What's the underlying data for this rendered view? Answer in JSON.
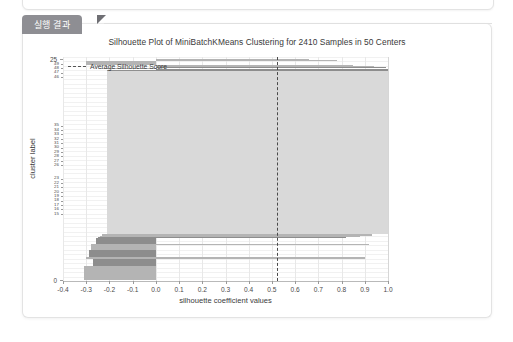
{
  "panel": {
    "tab_label": "실행 결과"
  },
  "chart_data": {
    "type": "bar",
    "title": "Silhouette Plot of MiniBatchKMeans Clustering for 2410 Samples in 50 Centers",
    "xlabel": "silhouette coefficient values",
    "ylabel": "cluster label",
    "xlim": [
      -0.4,
      1.0
    ],
    "ylim": [
      0,
      50
    ],
    "grid": true,
    "legend_position": "upper left",
    "legend": [
      {
        "name": "Average Silhouette Score",
        "style": "dashed",
        "color": "#4a4a4a"
      }
    ],
    "annotations": [
      {
        "label": "Average Silhouette Score",
        "type": "vline",
        "x": 0.52
      }
    ],
    "xticks": [
      "-0.4",
      "-0.3",
      "-0.2",
      "-0.1",
      "0.0",
      "0.1",
      "0.2",
      "0.3",
      "0.4",
      "0.5",
      "0.6",
      "0.7",
      "0.8",
      "0.9",
      "1.0"
    ],
    "xtick_values": [
      -0.4,
      -0.3,
      -0.2,
      -0.1,
      0.0,
      0.1,
      0.2,
      0.3,
      0.4,
      0.5,
      0.6,
      0.7,
      0.8,
      0.9,
      1.0
    ],
    "yticks_major": [
      "0",
      "25"
    ],
    "ytick_major_values": [
      0,
      25
    ],
    "average_silhouette_score": 0.52,
    "n_samples": 2410,
    "n_clusters": 50,
    "categories": [
      "0",
      "1",
      "2",
      "3",
      "4",
      "5",
      "6",
      "7",
      "8",
      "9",
      "10",
      "11",
      "12",
      "13",
      "14",
      "15",
      "16",
      "17",
      "18",
      "19",
      "20",
      "21",
      "22",
      "23",
      "24",
      "25",
      "26",
      "27",
      "28",
      "29",
      "30",
      "31",
      "32",
      "33",
      "34",
      "35",
      "36",
      "37",
      "38",
      "39",
      "40",
      "41",
      "42",
      "43",
      "44",
      "45",
      "46",
      "47",
      "48",
      "49"
    ],
    "series": [
      {
        "name": "silhouette band extent",
        "note": "per-cluster band: [x_start, x_end, size_fraction, shade]",
        "bands": [
          {
            "cluster": 0,
            "x_start": -0.31,
            "x_end": 0.0,
            "size": 0.062,
            "shade": "mid"
          },
          {
            "cluster": 1,
            "x_start": -0.27,
            "x_end": 0.0,
            "size": 0.03,
            "shade": "dark"
          },
          {
            "cluster": 2,
            "x_start": -0.3,
            "x_end": 0.9,
            "size": 0.006,
            "shade": "mid"
          },
          {
            "cluster": 3,
            "x_start": -0.29,
            "x_end": 0.0,
            "size": 0.03,
            "shade": "dark"
          },
          {
            "cluster": 4,
            "x_start": -0.28,
            "x_end": 0.0,
            "size": 0.02,
            "shade": "mid"
          },
          {
            "cluster": 5,
            "x_start": -0.28,
            "x_end": 0.92,
            "size": 0.006,
            "shade": "mid"
          },
          {
            "cluster": 6,
            "x_start": -0.26,
            "x_end": 0.0,
            "size": 0.026,
            "shade": "dark"
          },
          {
            "cluster": 7,
            "x_start": -0.25,
            "x_end": 0.82,
            "size": 0.005,
            "shade": "dark"
          },
          {
            "cluster": 8,
            "x_start": -0.24,
            "x_end": 0.88,
            "size": 0.005,
            "shade": "mid"
          },
          {
            "cluster": 9,
            "x_start": -0.23,
            "x_end": 0.93,
            "size": 0.005,
            "shade": "mid"
          },
          {
            "cluster": 10,
            "x_start": -0.21,
            "x_end": 1.0,
            "size": 0.7,
            "shade": "light"
          },
          {
            "cluster": 11,
            "x_start": 0.0,
            "x_end": 1.0,
            "size": 0.008,
            "shade": "dark"
          },
          {
            "cluster": 12,
            "x_start": -0.24,
            "x_end": 0.0,
            "size": 0.005,
            "shade": "mid"
          },
          {
            "cluster": 13,
            "x_start": 0.0,
            "x_end": 0.99,
            "size": 0.006,
            "shade": "dark"
          },
          {
            "cluster": 14,
            "x_start": 0.0,
            "x_end": 0.94,
            "size": 0.004,
            "shade": "mid"
          },
          {
            "cluster": 15,
            "x_start": 0.0,
            "x_end": 0.85,
            "size": 0.004,
            "shade": "mid"
          },
          {
            "cluster": 16,
            "x_start": -0.3,
            "x_end": 0.0,
            "size": 0.016,
            "shade": "mid"
          },
          {
            "cluster": 17,
            "x_start": 0.0,
            "x_end": 0.78,
            "size": 0.004,
            "shade": "mid"
          },
          {
            "cluster": 18,
            "x_start": 0.0,
            "x_end": 0.66,
            "size": 0.003,
            "shade": "mid"
          }
        ]
      }
    ]
  }
}
